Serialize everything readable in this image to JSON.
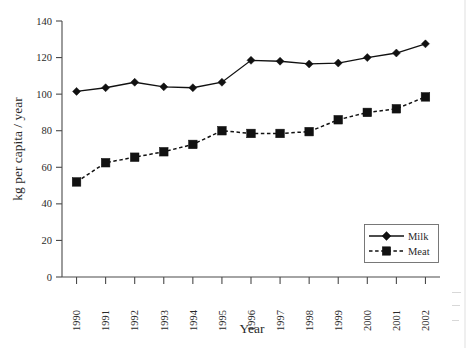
{
  "chart_data": {
    "type": "line",
    "title": "",
    "xlabel": "Year",
    "ylabel": "kg per capita / year",
    "categories": [
      "1990",
      "1991",
      "1992",
      "1993",
      "1994",
      "1995",
      "1996",
      "1997",
      "1998",
      "1999",
      "2000",
      "2001",
      "2002"
    ],
    "series": [
      {
        "name": "Milk",
        "marker": "diamond",
        "linestyle": "solid",
        "color": "#111111",
        "values": [
          101.5,
          103.5,
          106.5,
          104,
          103.5,
          106.5,
          118.5,
          118,
          116.5,
          117,
          120,
          122.5,
          127.5
        ]
      },
      {
        "name": "Meat",
        "marker": "square",
        "linestyle": "dashed",
        "color": "#111111",
        "values": [
          52,
          62.5,
          65.5,
          68.5,
          72.5,
          80,
          78.5,
          78.5,
          79.5,
          86,
          90,
          92,
          98.5
        ]
      }
    ],
    "ylim": [
      0,
      140
    ],
    "yticks": [
      0,
      20,
      40,
      60,
      80,
      100,
      120,
      140
    ],
    "ytick_labels": [
      "0",
      "20",
      "40",
      "60",
      "80",
      "100",
      "120",
      "140"
    ],
    "xtick_rotation": 90,
    "grid": false,
    "legend_position": "lower-right",
    "legend_entries": [
      "Milk",
      "Meat"
    ]
  },
  "legend": {
    "items": [
      {
        "label": "Milk"
      },
      {
        "label": "Meat"
      }
    ]
  },
  "axes": {
    "x_title": "Year",
    "y_title": "kg per capita / year"
  }
}
